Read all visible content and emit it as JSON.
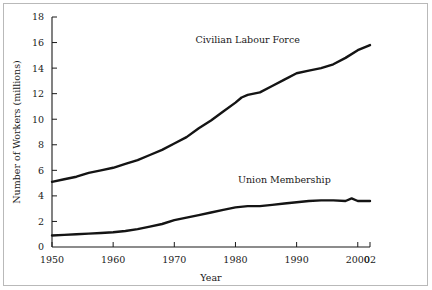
{
  "chart_data": {
    "type": "line",
    "title": "",
    "subtitle": "",
    "xlabel": "Year",
    "ylabel": "Number of Workers (millions)",
    "xlim": [
      1950,
      2002
    ],
    "ylim": [
      0,
      18
    ],
    "grid": false,
    "legend_position": "inline-annotation",
    "x_tick_labels": [
      "1950",
      "1960",
      "1970",
      "1980",
      "1990",
      "2000",
      "02"
    ],
    "x_tick_values": [
      1950,
      1960,
      1970,
      1980,
      1990,
      2000,
      2002
    ],
    "y_tick_labels": [
      "0",
      "2",
      "4",
      "6",
      "8",
      "10",
      "12",
      "14",
      "16",
      "18"
    ],
    "y_tick_values": [
      0,
      2,
      4,
      6,
      8,
      10,
      12,
      14,
      16,
      18
    ],
    "series": [
      {
        "name": "Civilian Labour Force",
        "label_x": 1982,
        "label_y": 16.0,
        "color": "#141414",
        "x": [
          1950,
          1952,
          1954,
          1956,
          1958,
          1960,
          1962,
          1964,
          1966,
          1968,
          1970,
          1972,
          1974,
          1976,
          1978,
          1980,
          1981,
          1982,
          1984,
          1986,
          1988,
          1990,
          1992,
          1994,
          1996,
          1998,
          2000,
          2002
        ],
        "values": [
          5.1,
          5.3,
          5.5,
          5.8,
          6.0,
          6.2,
          6.5,
          6.8,
          7.2,
          7.6,
          8.1,
          8.6,
          9.3,
          9.9,
          10.6,
          11.3,
          11.7,
          11.9,
          12.1,
          12.6,
          13.1,
          13.6,
          13.8,
          14.0,
          14.3,
          14.8,
          15.4,
          15.8
        ]
      },
      {
        "name": "Union Membership",
        "label_x": 1988,
        "label_y": 5.0,
        "color": "#141414",
        "x": [
          1950,
          1952,
          1954,
          1956,
          1958,
          1960,
          1962,
          1964,
          1966,
          1968,
          1970,
          1972,
          1974,
          1976,
          1978,
          1980,
          1982,
          1984,
          1986,
          1988,
          1990,
          1992,
          1994,
          1996,
          1998,
          1999,
          2000,
          2001,
          2002
        ],
        "values": [
          0.9,
          0.95,
          1.0,
          1.05,
          1.1,
          1.15,
          1.25,
          1.4,
          1.6,
          1.8,
          2.1,
          2.3,
          2.5,
          2.7,
          2.9,
          3.1,
          3.2,
          3.2,
          3.3,
          3.4,
          3.5,
          3.6,
          3.65,
          3.65,
          3.6,
          3.8,
          3.6,
          3.6,
          3.6
        ]
      }
    ]
  },
  "figure": {
    "background_color": "#ffffff",
    "border_color": "#b9b9b9",
    "line_color": "#141414",
    "text_color": "#1a1a1a"
  }
}
